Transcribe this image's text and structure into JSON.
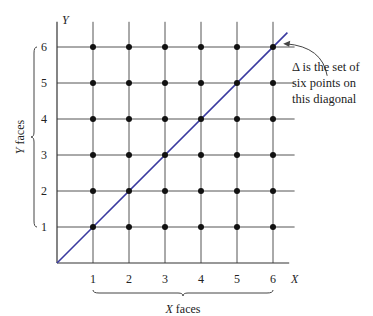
{
  "chart_data": {
    "type": "scatter",
    "title": "",
    "xlabel": "X",
    "ylabel": "Y",
    "x_ticks": [
      "1",
      "2",
      "3",
      "4",
      "5",
      "6"
    ],
    "y_ticks": [
      "1",
      "2",
      "3",
      "4",
      "5",
      "6"
    ],
    "xlim": [
      0,
      6.5
    ],
    "ylim": [
      0,
      6.7
    ],
    "grid": true,
    "points": [
      [
        1,
        1
      ],
      [
        2,
        1
      ],
      [
        3,
        1
      ],
      [
        4,
        1
      ],
      [
        5,
        1
      ],
      [
        6,
        1
      ],
      [
        1,
        2
      ],
      [
        2,
        2
      ],
      [
        3,
        2
      ],
      [
        4,
        2
      ],
      [
        5,
        2
      ],
      [
        6,
        2
      ],
      [
        1,
        3
      ],
      [
        2,
        3
      ],
      [
        3,
        3
      ],
      [
        4,
        3
      ],
      [
        5,
        3
      ],
      [
        6,
        3
      ],
      [
        1,
        4
      ],
      [
        2,
        4
      ],
      [
        3,
        4
      ],
      [
        4,
        4
      ],
      [
        5,
        4
      ],
      [
        6,
        4
      ],
      [
        1,
        5
      ],
      [
        2,
        5
      ],
      [
        3,
        5
      ],
      [
        4,
        5
      ],
      [
        5,
        5
      ],
      [
        6,
        5
      ],
      [
        1,
        6
      ],
      [
        2,
        6
      ],
      [
        3,
        6
      ],
      [
        4,
        6
      ],
      [
        5,
        6
      ],
      [
        6,
        6
      ]
    ],
    "diagonal": {
      "from": [
        0,
        0
      ],
      "to": [
        6.4,
        6.4
      ],
      "color": "#3a3aa0"
    },
    "x_brace_label": "faces",
    "x_brace_var": "X",
    "y_brace_label": "faces",
    "y_brace_var": "Y",
    "annotation": {
      "lines": [
        "Δ is the set of",
        "six points on",
        "this diagonal"
      ],
      "points_to": [
        6.2,
        6.2
      ]
    }
  },
  "colors": {
    "grid": "#555555",
    "point": "#111111",
    "diagonal": "#3a3aa0"
  }
}
